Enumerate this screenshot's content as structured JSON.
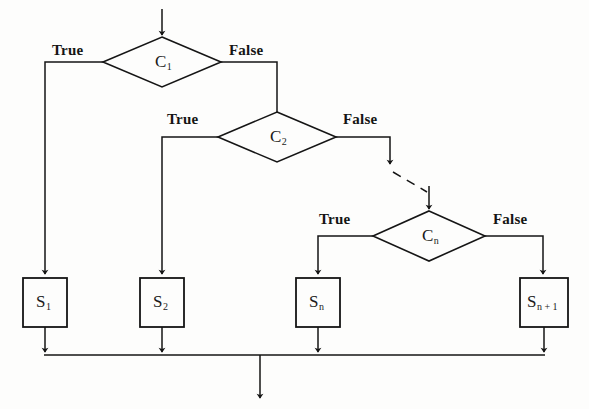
{
  "diagram": {
    "type": "flowchart",
    "background_color": "#fdfdfc",
    "stroke_color": "#151515",
    "canvas": {
      "width": 589,
      "height": 409
    }
  },
  "nodes": {
    "decisions": [
      {
        "id": "c1",
        "shape": "diamond",
        "label": "C",
        "subscript": "1",
        "center": {
          "x": 162,
          "y": 62
        },
        "half_width": 59,
        "half_height": 25,
        "true_label": "True",
        "false_label": "False"
      },
      {
        "id": "c2",
        "shape": "diamond",
        "label": "C",
        "subscript": "2",
        "center": {
          "x": 277,
          "y": 137
        },
        "half_width": 59,
        "half_height": 25,
        "true_label": "True",
        "false_label": "False"
      },
      {
        "id": "cn",
        "shape": "diamond",
        "label": "C",
        "subscript": "n",
        "center": {
          "x": 429,
          "y": 236
        },
        "half_width": 56,
        "half_height": 25,
        "true_label": "True",
        "false_label": "False"
      }
    ],
    "processes": [
      {
        "id": "s1",
        "shape": "rect",
        "label": "S",
        "subscript": "1",
        "x": 23,
        "y": 278,
        "width": 44,
        "height": 49
      },
      {
        "id": "s2",
        "shape": "rect",
        "label": "S",
        "subscript": "2",
        "x": 140,
        "y": 278,
        "width": 44,
        "height": 49
      },
      {
        "id": "sn",
        "shape": "rect",
        "label": "S",
        "subscript": "n",
        "x": 296,
        "y": 278,
        "width": 44,
        "height": 49
      },
      {
        "id": "sn1",
        "shape": "rect",
        "label": "S",
        "subscript": "n + 1",
        "x": 520,
        "y": 278,
        "width": 48,
        "height": 49
      }
    ]
  },
  "labels": {
    "c1_true": {
      "text": "True",
      "x": 52,
      "y": 44
    },
    "c1_false": {
      "text": "False",
      "x": 229,
      "y": 44
    },
    "c2_true": {
      "text": "True",
      "x": 167,
      "y": 113
    },
    "c2_false": {
      "text": "False",
      "x": 343,
      "y": 113
    },
    "cn_true": {
      "text": "True",
      "x": 319,
      "y": 213
    },
    "cn_false": {
      "text": "False",
      "x": 493,
      "y": 213
    }
  },
  "connectors": {
    "entry_arrow": {
      "from": {
        "x": 162,
        "y": 9
      },
      "to": {
        "x": 162,
        "y": 37
      },
      "style": "solid"
    },
    "c1_true_path": {
      "description": "C1 left vertex to S1 top",
      "style": "solid"
    },
    "c1_false_path": {
      "description": "C1 right vertex to C2 top vertex",
      "style": "solid"
    },
    "c2_true_path": {
      "description": "C2 left vertex to S2 top",
      "style": "solid"
    },
    "c2_false_path": {
      "description": "C2 right vertex down, dashed diagonal to Cn top vertex",
      "style": "dashed-ellipsis"
    },
    "cn_true_path": {
      "description": "Cn left vertex to Sn top",
      "style": "solid"
    },
    "cn_false_path": {
      "description": "Cn right vertex to Sn+1 top",
      "style": "solid"
    },
    "merge_line": {
      "y": 355,
      "x_start": 44,
      "x_end": 545,
      "style": "solid"
    },
    "exit_arrow": {
      "from": {
        "x": 260,
        "y": 355
      },
      "to": {
        "x": 260,
        "y": 400
      },
      "style": "solid"
    }
  }
}
